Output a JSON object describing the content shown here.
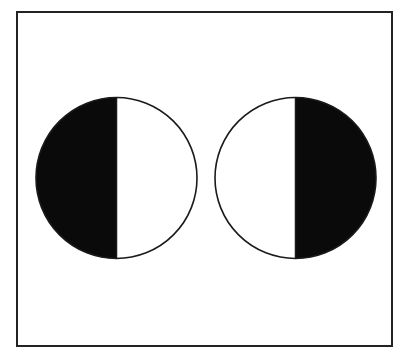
{
  "diagram": {
    "canvas": {
      "width": 404,
      "height": 361,
      "background": "#ffffff"
    },
    "frame": {
      "x": 17,
      "y": 12,
      "width": 375,
      "height": 334,
      "stroke": "#222222",
      "stroke_width": 2
    },
    "colors": {
      "fill_dark": "#0a0a0a",
      "fill_light": "#ffffff",
      "outline": "#1a1a1a"
    },
    "circles": [
      {
        "name": "left-circle",
        "cx": 116.5,
        "cy": 178,
        "r": 80.5,
        "filled_half": "left"
      },
      {
        "name": "right-circle",
        "cx": 295.5,
        "cy": 178,
        "r": 80.5,
        "filled_half": "right"
      }
    ]
  }
}
